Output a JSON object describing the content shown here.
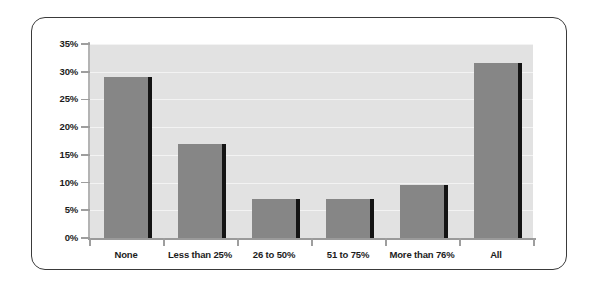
{
  "chart_data": {
    "type": "bar",
    "title": "",
    "subtitle": "",
    "xlabel": "",
    "ylabel": "",
    "categories": [
      "None",
      "Less than 25%",
      "26 to 50%",
      "51 to 75%",
      "More than 76%",
      "All"
    ],
    "values": [
      29,
      17,
      7,
      7,
      9.5,
      31.5
    ],
    "series": [
      {
        "name": "Percent of respondents",
        "values": [
          29,
          17,
          7,
          7,
          9.5,
          31.5
        ]
      }
    ],
    "ylim": [
      0,
      35
    ],
    "ytick_values": [
      0,
      5,
      10,
      15,
      20,
      25,
      30,
      35
    ],
    "ytick_labels": [
      "0%",
      "5%",
      "10%",
      "15%",
      "20%",
      "25%",
      "30%",
      "35%"
    ],
    "grid": true,
    "legend": false,
    "legend_position": "none",
    "annotations": [],
    "colors": {
      "bar_fill": "#868686",
      "bar_shadow": "#141414",
      "plot_background": "#e2e2e2",
      "gridline": "#f3f3f3",
      "axis_line": "#9e9e9e",
      "frame_border": "#3a3a3a",
      "page_background": "#ffffff",
      "label_text": "#1c1c1c"
    }
  }
}
